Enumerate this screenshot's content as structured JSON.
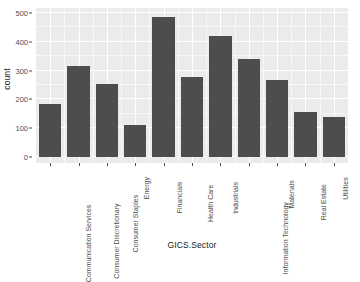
{
  "chart_data": {
    "type": "bar",
    "title": "",
    "xlabel": "GICS.Sector",
    "ylabel": "count",
    "categories": [
      "Communication Services",
      "Consumer Discretionary",
      "Consumer Staples",
      "Energy",
      "Financials",
      "Health Care",
      "Industrials",
      "Information Technology",
      "Materials",
      "Real Estate",
      "Utilities"
    ],
    "values": [
      185,
      317,
      253,
      110,
      486,
      278,
      420,
      340,
      268,
      157,
      140
    ],
    "ylim": [
      0,
      510
    ],
    "yticks": [
      0,
      100,
      200,
      300,
      400,
      500
    ],
    "ytick_labels": [
      "0",
      "100",
      "200",
      "300",
      "400",
      "500"
    ],
    "grid": true,
    "legend": "none",
    "colors": {
      "bar_fill": "#4d4d4d",
      "panel_background": "#ebebeb",
      "major_gridline": "#ffffff",
      "minor_gridline": "#f7f7f7",
      "axis_text": "#4d4d4d",
      "axis_title": "#1a1a1a",
      "plot_background": "#ffffff"
    }
  }
}
